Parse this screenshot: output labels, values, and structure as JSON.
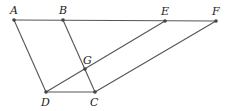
{
  "diagram": {
    "points": {
      "A": {
        "label": "A",
        "x": 14,
        "y": 20,
        "lx": 10,
        "ly": 14
      },
      "B": {
        "label": "B",
        "x": 63,
        "y": 20,
        "lx": 59,
        "ly": 14
      },
      "E": {
        "label": "E",
        "x": 165,
        "y": 21,
        "lx": 161,
        "ly": 15
      },
      "F": {
        "label": "F",
        "x": 216,
        "y": 21,
        "lx": 212,
        "ly": 15
      },
      "G": {
        "label": "G",
        "x": 85,
        "y": 69,
        "lx": 83,
        "ly": 64
      },
      "D": {
        "label": "D",
        "x": 46,
        "y": 92,
        "lx": 41,
        "ly": 106
      },
      "C": {
        "label": "C",
        "x": 95,
        "y": 92,
        "lx": 90,
        "ly": 106
      }
    },
    "segments": [
      [
        "A",
        "F"
      ],
      [
        "A",
        "D"
      ],
      [
        "B",
        "C"
      ],
      [
        "D",
        "C"
      ],
      [
        "D",
        "E"
      ],
      [
        "C",
        "F"
      ]
    ]
  }
}
